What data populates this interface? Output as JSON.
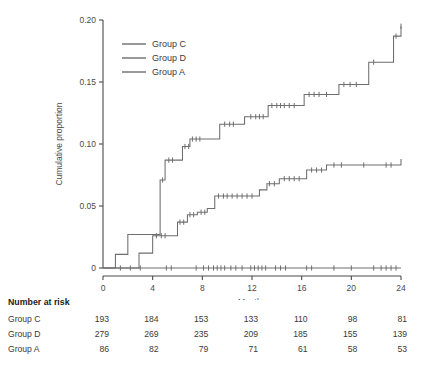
{
  "chart_data": {
    "type": "line",
    "title": "",
    "xlabel": "Months",
    "ylabel": "Cumulative proportion",
    "xlim": [
      0,
      24
    ],
    "ylim": [
      0,
      0.2
    ],
    "xticks": [
      0,
      4,
      8,
      12,
      16,
      20,
      24
    ],
    "xtick_labels": [
      "0",
      "4",
      "8",
      "12",
      "16",
      "20",
      "24"
    ],
    "yticks": [
      0,
      0.05,
      0.1,
      0.15,
      0.2
    ],
    "ytick_labels": [
      "0",
      "0.05",
      "0.10",
      "0.15",
      "0.20"
    ],
    "grid": false,
    "legend_position": "upper-left",
    "step": "post",
    "series": [
      {
        "name": "Group C",
        "color": "#6e6e6e",
        "x": [
          0,
          1.0,
          2.0,
          3.0,
          4.6,
          5.0,
          6.4,
          7.0,
          8.6,
          9.4,
          10.6,
          11.4,
          12.2,
          13.3,
          14.6,
          16.2,
          17.4,
          19.0,
          20.6,
          21.4,
          22.6,
          23.4,
          24.0
        ],
        "y": [
          0,
          0.011,
          0.027,
          0.027,
          0.071,
          0.087,
          0.098,
          0.104,
          0.104,
          0.116,
          0.116,
          0.122,
          0.122,
          0.131,
          0.131,
          0.14,
          0.14,
          0.148,
          0.148,
          0.166,
          0.166,
          0.187,
          0.195
        ],
        "censor_x": [
          4.8,
          5.3,
          5.6,
          6.6,
          6.9,
          7.2,
          7.5,
          7.8,
          9.8,
          10.2,
          10.5,
          11.9,
          12.3,
          12.6,
          12.9,
          13.6,
          14.0,
          14.3,
          14.6,
          15.0,
          15.4,
          16.6,
          17.0,
          17.4,
          18.0,
          19.4,
          19.9,
          20.4,
          21.8,
          23.6,
          24.0
        ]
      },
      {
        "name": "Group D",
        "color": "#6e6e6e",
        "x": [
          0,
          2.9,
          4.0,
          5.4,
          6.0,
          6.8,
          7.6,
          8.4,
          9.0,
          11.2,
          12.6,
          13.2,
          14.2,
          16.4,
          18.0,
          20.0,
          22.4,
          23.6,
          24.0
        ],
        "y": [
          0,
          0.012,
          0.026,
          0.026,
          0.037,
          0.043,
          0.045,
          0.048,
          0.058,
          0.058,
          0.063,
          0.068,
          0.072,
          0.079,
          0.083,
          0.083,
          0.083,
          0.083,
          0.088
        ],
        "censor_x": [
          4.3,
          4.7,
          5.0,
          6.2,
          6.5,
          7.0,
          7.3,
          7.9,
          8.2,
          9.3,
          9.7,
          10.0,
          10.4,
          10.8,
          11.2,
          11.6,
          12.0,
          13.4,
          13.8,
          14.6,
          15.0,
          15.4,
          15.8,
          16.8,
          17.2,
          17.6,
          18.6,
          19.2,
          21.0,
          22.8,
          23.2
        ]
      },
      {
        "name": "Group A",
        "color": "#6e6e6e",
        "x": [
          0,
          24
        ],
        "y": [
          0,
          0
        ],
        "censor_x": [
          1.4,
          2.2,
          3.0,
          5.1,
          5.5,
          7.5,
          8.1,
          8.5,
          8.9,
          9.2,
          9.5,
          9.8,
          10.3,
          10.7,
          11.2,
          11.9,
          12.2,
          12.5,
          12.8,
          13.1,
          13.9,
          14.3,
          14.7,
          16.4,
          16.8,
          18.6,
          20.0,
          21.8,
          22.4,
          22.8,
          23.2,
          23.6
        ]
      }
    ]
  },
  "legend": {
    "items": [
      {
        "label": "Group C"
      },
      {
        "label": "Group D"
      },
      {
        "label": "Group A"
      }
    ]
  },
  "risk_table": {
    "title": "Number at risk",
    "columns": [
      "0",
      "4",
      "8",
      "12",
      "16",
      "20",
      "24"
    ],
    "rows": [
      {
        "name": "Group C",
        "values": [
          "193",
          "184",
          "153",
          "133",
          "110",
          "98",
          "81"
        ]
      },
      {
        "name": "Group D",
        "values": [
          "279",
          "269",
          "235",
          "209",
          "185",
          "155",
          "139"
        ]
      },
      {
        "name": "Group A",
        "values": [
          "86",
          "82",
          "79",
          "71",
          "61",
          "58",
          "53"
        ]
      }
    ]
  }
}
